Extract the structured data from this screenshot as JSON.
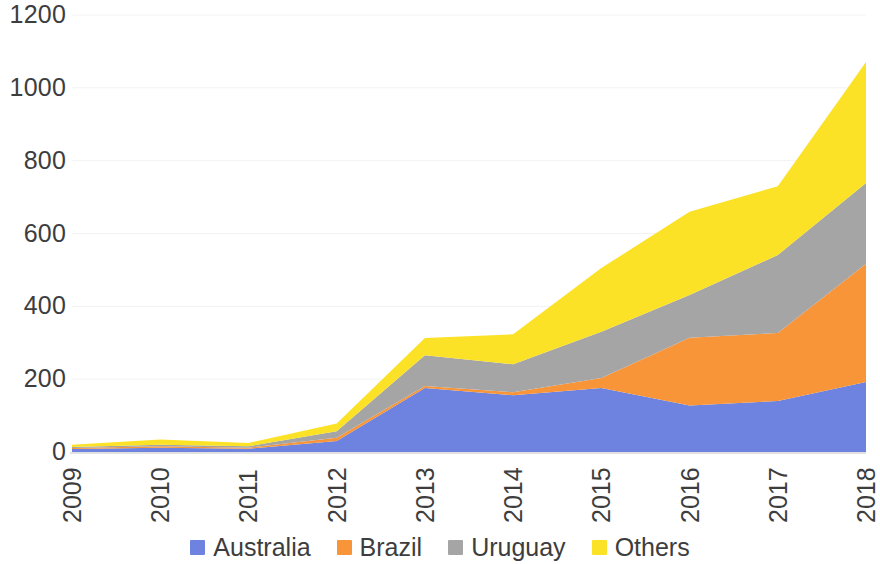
{
  "chart_data": {
    "type": "area",
    "stacked": true,
    "title": "",
    "subtitle": "",
    "xlabel": "",
    "ylabel": "",
    "categories": [
      "2009",
      "2010",
      "2011",
      "2012",
      "2013",
      "2014",
      "2015",
      "2016",
      "2017",
      "2018"
    ],
    "x_tick_labels": [
      "2009",
      "2010",
      "2011",
      "2012",
      "2013",
      "2014",
      "2015",
      "2016",
      "2017",
      "2018"
    ],
    "y_tick_labels": [
      "0",
      "200",
      "400",
      "600",
      "800",
      "1000",
      "1200"
    ],
    "y_ticks": [
      0,
      200,
      400,
      600,
      800,
      1000,
      1200
    ],
    "ylim": [
      0,
      1200
    ],
    "grid": true,
    "legend_position": "bottom",
    "series": [
      {
        "name": "Australia",
        "color": "#6E83E0",
        "values": [
          8,
          12,
          9,
          30,
          176,
          156,
          176,
          128,
          140,
          192
        ]
      },
      {
        "name": "Brazil",
        "color": "#F89538",
        "values": [
          3,
          4,
          3,
          9,
          5,
          8,
          27,
          186,
          187,
          325
        ]
      },
      {
        "name": "Uruguay",
        "color": "#A5A5A5",
        "values": [
          3,
          4,
          4,
          18,
          85,
          77,
          127,
          117,
          214,
          222
        ]
      },
      {
        "name": "Others",
        "color": "#FBE227",
        "values": [
          6,
          14,
          9,
          21,
          47,
          82,
          175,
          229,
          189,
          332
        ]
      }
    ],
    "totals": [
      20,
      34,
      25,
      78,
      313,
      323,
      505,
      660,
      730,
      1071
    ]
  },
  "legend": {
    "items": [
      {
        "label": "Australia",
        "color": "#6E83E0",
        "swatch": "legend-swatch-australia"
      },
      {
        "label": "Brazil",
        "color": "#F89538",
        "swatch": "legend-swatch-brazil"
      },
      {
        "label": "Uruguay",
        "color": "#A5A5A5",
        "swatch": "legend-swatch-uruguay"
      },
      {
        "label": "Others",
        "color": "#FBE227",
        "swatch": "legend-swatch-others"
      }
    ]
  },
  "axes": {
    "y_labels": [
      "1200",
      "1000",
      "800",
      "600",
      "400",
      "200",
      "0"
    ],
    "x_labels": [
      "2009",
      "2010",
      "2011",
      "2012",
      "2013",
      "2014",
      "2015",
      "2016",
      "2017",
      "2018"
    ]
  }
}
